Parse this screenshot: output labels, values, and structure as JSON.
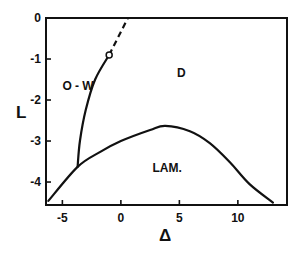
{
  "chart_data": {
    "type": "line",
    "title": "",
    "xlabel": "Δ",
    "ylabel": "L",
    "xlim": [
      -6.4,
      14.2
    ],
    "ylim": [
      -4.56,
      0
    ],
    "xticks": [
      -5,
      0,
      5,
      10
    ],
    "yticks": [
      0,
      -1,
      -2,
      -3,
      -4
    ],
    "grid": false,
    "legend": null,
    "region_labels": [
      {
        "text": "O - W",
        "x": -5.0,
        "y": -1.75
      },
      {
        "text": "D",
        "x": 4.8,
        "y": -1.45
      },
      {
        "text": "LAM.",
        "x": 2.7,
        "y": -3.75
      }
    ],
    "series": [
      {
        "name": "LAM. boundary",
        "style": "solid",
        "x": [
          -6.2,
          -3.7,
          -1.8,
          0.0,
          2.5,
          3.8,
          5.9,
          7.6,
          9.3,
          11.0,
          13.0
        ],
        "y": [
          -4.46,
          -3.63,
          -3.27,
          -3.0,
          -2.73,
          -2.63,
          -2.76,
          -3.05,
          -3.51,
          -4.05,
          -4.5
        ]
      },
      {
        "name": "O-W boundary",
        "style": "solid",
        "x": [
          -3.7,
          -3.5,
          -3.0,
          -2.2,
          -1.0
        ],
        "y": [
          -3.63,
          -3.0,
          -2.24,
          -1.5,
          -0.9
        ]
      },
      {
        "name": "O-W boundary (extrapolated)",
        "style": "dashed",
        "x": [
          -1.0,
          0.6
        ],
        "y": [
          -0.9,
          0.0
        ]
      }
    ],
    "markers": [
      {
        "name": "open-circle",
        "x": -1.0,
        "y": -0.9
      }
    ]
  },
  "labels": {
    "x_axis": "Δ",
    "y_axis": "L",
    "region_ow": "O - W",
    "region_d": "D",
    "region_lam": "LAM."
  }
}
